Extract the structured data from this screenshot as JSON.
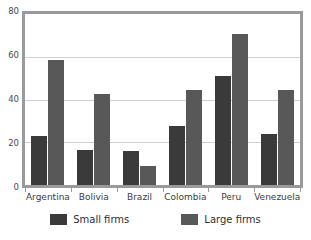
{
  "chart_data": {
    "type": "bar",
    "title": "",
    "subtitle": "",
    "xlabel": "",
    "ylabel": "",
    "ylim": [
      0,
      80
    ],
    "yticks": [
      0,
      20,
      40,
      60,
      80
    ],
    "grid": true,
    "legend_position": "bottom",
    "categories": [
      "Argentina",
      "Bolivia",
      "Brazil",
      "Colombia",
      "Peru",
      "Venezuela"
    ],
    "series": [
      {
        "name": "Small firms",
        "color": "#3a3a3a",
        "values": [
          23,
          16.5,
          16,
          27.5,
          51,
          24
        ]
      },
      {
        "name": "Large firms",
        "color": "#585858",
        "values": [
          58.5,
          42.5,
          9,
          44.5,
          70.5,
          44.5
        ]
      }
    ]
  },
  "axis": {
    "ytick_labels": [
      "80",
      "60",
      "40",
      "20",
      "0"
    ]
  },
  "legend": {
    "items": [
      {
        "label": "Small firms",
        "swatch": "legend-swatch-small"
      },
      {
        "label": "Large firms",
        "swatch": "legend-swatch-large"
      }
    ]
  }
}
